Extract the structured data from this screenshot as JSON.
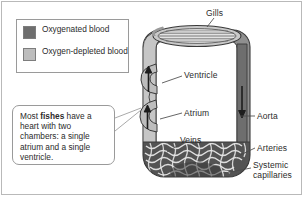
{
  "figure": {
    "width": 305,
    "height": 198,
    "background": "#ffffff",
    "border_color": "#b9b9b9"
  },
  "legend": {
    "items": [
      {
        "label": "Oxygenated blood",
        "color": "#6e6e6e",
        "swatch_name": "oxygenated-blood-swatch"
      },
      {
        "label": "Oxygen-depleted blood",
        "color": "#bdbdbd",
        "swatch_name": "oxygen-depleted-blood-swatch"
      }
    ]
  },
  "callout": {
    "text_before": "Most ",
    "text_bold": "fishes",
    "text_after": " have a heart with two chambers: a single atrium and a single ventricle."
  },
  "labels": {
    "gills": "Gills",
    "ventricle": "Ventricle",
    "atrium": "Atrium",
    "veins": "Veins",
    "aorta": "Aorta",
    "arteries": "Arteries",
    "systemic_capillaries": "Systemic capillaries"
  },
  "colors": {
    "oxygenated": "#6e6e6e",
    "oxygen_depleted": "#bdbdbd",
    "outline": "#3a3a3a",
    "text": "#2b2b2b",
    "leader_line": "#4a4a4a",
    "capillary_mesh": "#555555"
  },
  "flow": {
    "arrows": [
      {
        "name": "atrium-flow-arrow",
        "direction": "up"
      },
      {
        "name": "ventricle-flow-arrow",
        "direction": "up"
      },
      {
        "name": "aorta-flow-arrow",
        "direction": "down"
      }
    ]
  }
}
